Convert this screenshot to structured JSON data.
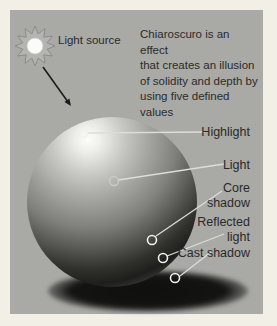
{
  "colors": {
    "frame": "#f2efe7",
    "panel": "#a9a9a6",
    "text": "#2b2b2b",
    "leader_line": "#dcdcd9",
    "marker_ring": "#f0f0ed",
    "arrow": "#1c1c1c",
    "sphere_highlight": "#fdfdfb",
    "sphere_core_shadow": "#1e1e1c"
  },
  "icons": {
    "light_source": "sun-starburst-icon"
  },
  "light_source": {
    "label": "Light source"
  },
  "description": {
    "lines": [
      "Chiaroscuro is an effect",
      "that creates an illusion",
      "of solidity and depth by",
      "using five defined values"
    ]
  },
  "annotations": [
    {
      "id": "highlight",
      "label": "Highlight"
    },
    {
      "id": "light",
      "label": "Light"
    },
    {
      "id": "core-shadow",
      "label": "Core shadow"
    },
    {
      "id": "reflected-light",
      "label": "Reflected light"
    },
    {
      "id": "cast-shadow",
      "label": "Cast shadow"
    }
  ]
}
